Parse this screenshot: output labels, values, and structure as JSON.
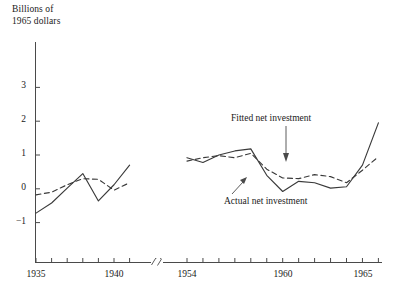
{
  "chart_data": {
    "type": "line",
    "title": "",
    "ylabel": "Billions of\n1965 dollars",
    "xlabel": "",
    "ylim": [
      -1.6,
      3.4
    ],
    "yticks": [
      -1,
      0,
      1,
      2,
      3
    ],
    "ytick_labels": [
      "−1",
      "0",
      "1",
      "2",
      "3"
    ],
    "xlim_left": [
      1935,
      1941
    ],
    "xlim_right": [
      1954,
      1966
    ],
    "xticks_left": [
      1935,
      1936,
      1937,
      1938,
      1939,
      1940,
      1941
    ],
    "xticks_right": [
      1954,
      1955,
      1956,
      1957,
      1958,
      1959,
      1960,
      1961,
      1962,
      1963,
      1964,
      1965,
      1966
    ],
    "xtick_labels": [
      "1935",
      "1940",
      "1954",
      "1960",
      "1965"
    ],
    "labeled_xticks": [
      1935,
      1940,
      1954,
      1960,
      1965
    ],
    "axis_break": true,
    "axis_break_note": "break in x-axis between 1941 and 1954",
    "grid": false,
    "legend": "annotations",
    "annotations": [
      {
        "text": "Fitted net investment",
        "points_to_series": "Fitted net investment"
      },
      {
        "text": "Actual net investment",
        "points_to_series": "Actual net investment"
      }
    ],
    "series": [
      {
        "name": "Actual net investment",
        "style": "solid",
        "color": "#3a3a3a",
        "segments": [
          {
            "x": [
              1935,
              1936,
              1937,
              1938,
              1939,
              1940,
              1941
            ],
            "y": [
              -0.72,
              -0.42,
              0.02,
              0.45,
              -0.36,
              0.12,
              0.7
            ]
          },
          {
            "x": [
              1954,
              1955,
              1956,
              1957,
              1958,
              1959,
              1960,
              1961,
              1962,
              1963,
              1964,
              1965,
              1966
            ],
            "y": [
              0.92,
              0.78,
              1.0,
              1.12,
              1.18,
              0.4,
              -0.08,
              0.22,
              0.18,
              0.02,
              0.06,
              0.7,
              1.95
            ]
          }
        ]
      },
      {
        "name": "Fitted net investment",
        "style": "dashed",
        "color": "#3a3a3a",
        "segments": [
          {
            "x": [
              1935,
              1936,
              1937,
              1938,
              1939,
              1940,
              1941
            ],
            "y": [
              -0.18,
              -0.1,
              0.12,
              0.3,
              0.28,
              -0.04,
              0.18
            ]
          },
          {
            "x": [
              1954,
              1955,
              1956,
              1957,
              1958,
              1959,
              1960,
              1961,
              1962,
              1963,
              1964,
              1965,
              1966
            ],
            "y": [
              0.82,
              0.92,
              0.98,
              0.92,
              1.05,
              0.58,
              0.32,
              0.3,
              0.42,
              0.36,
              0.18,
              0.55,
              0.95
            ]
          }
        ]
      }
    ]
  },
  "labels": {
    "y_axis_title_line1": "Billions of",
    "y_axis_title_line2": "1965 dollars",
    "fitted_annotation": "Fitted net investment",
    "actual_annotation": "Actual net investment",
    "ytick_neg1": "−1",
    "ytick_0": "0",
    "ytick_1": "1",
    "ytick_2": "2",
    "ytick_3": "3",
    "xtick_1935": "1935",
    "xtick_1940": "1940",
    "xtick_1954": "1954",
    "xtick_1960": "1960",
    "xtick_1965": "1965"
  }
}
